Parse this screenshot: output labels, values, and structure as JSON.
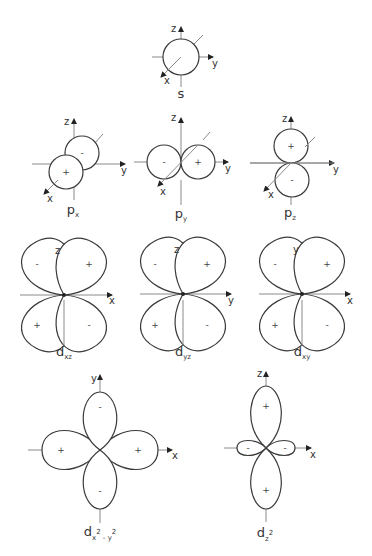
{
  "orbitals": {
    "s": {
      "label": "s",
      "axes": [
        "z",
        "y",
        "x"
      ],
      "signs": []
    },
    "px": {
      "label": "p",
      "sub": "x",
      "axes": [
        "z",
        "y",
        "x"
      ],
      "signs": [
        "+",
        "-"
      ]
    },
    "py": {
      "label": "p",
      "sub": "y",
      "axes": [
        "z",
        "y",
        "x"
      ],
      "signs": [
        "-",
        "+"
      ]
    },
    "pz": {
      "label": "p",
      "sub": "z",
      "axes": [
        "z",
        "y",
        "x"
      ],
      "signs": [
        "+",
        "-"
      ]
    },
    "dxz": {
      "label": "d",
      "sub": "xz",
      "axes": [
        "z",
        "x"
      ],
      "signs": [
        "-",
        "+",
        "+",
        "-"
      ]
    },
    "dyz": {
      "label": "d",
      "sub": "yz",
      "axes": [
        "z",
        "y"
      ],
      "signs": [
        "-",
        "+",
        "+",
        "-"
      ]
    },
    "dxy": {
      "label": "d",
      "sub": "xy",
      "axes": [
        "y",
        "x"
      ],
      "signs": [
        "-",
        "+",
        "+",
        "-"
      ]
    },
    "dx2y2": {
      "label": "d",
      "sub": "x",
      "sup1": "2",
      "mid": " - ",
      "sub2": "y",
      "sup2": "2",
      "axes": [
        "y",
        "x"
      ],
      "signs": [
        "-",
        "+",
        "+",
        "-"
      ]
    },
    "dz2": {
      "label": "d",
      "sub": "z",
      "sup1": "2",
      "axes": [
        "z",
        "x"
      ],
      "signs": [
        "+",
        "-",
        "-",
        "+"
      ]
    }
  },
  "colors": {
    "line": "#3a3a3a",
    "axis": "#8a8a8a",
    "background": "#ffffff"
  }
}
